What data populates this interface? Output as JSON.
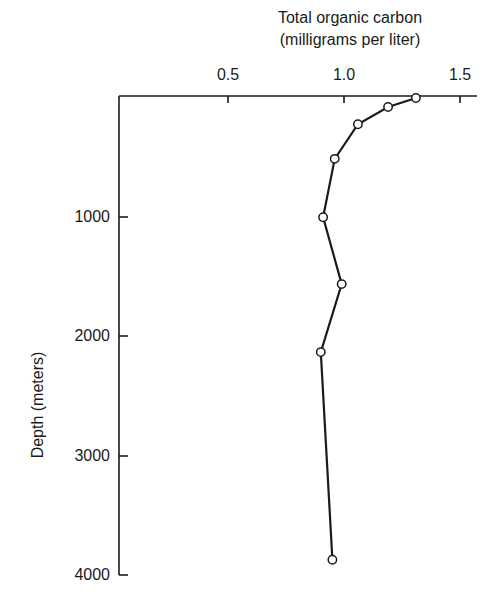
{
  "chart_data": {
    "type": "line",
    "title": "Total organic carbon",
    "subtitle": "(milligrams per liter)",
    "xlabel": "Total organic carbon (milligrams per liter)",
    "ylabel": "Depth (meters)",
    "x_axis_position": "top",
    "y_axis_inverted": true,
    "xlim": [
      0.0,
      1.55
    ],
    "ylim": [
      0,
      4000
    ],
    "x_ticks": [
      "0.5",
      "1.0",
      "1.5"
    ],
    "y_ticks": [
      "1000",
      "2000",
      "3000",
      "4000"
    ],
    "grid": false,
    "legend": null,
    "series": [
      {
        "name": "Total organic carbon profile",
        "marker": "open-circle",
        "points": [
          {
            "toc": 1.31,
            "depth": 0
          },
          {
            "toc": 1.19,
            "depth": 75
          },
          {
            "toc": 1.06,
            "depth": 220
          },
          {
            "toc": 0.96,
            "depth": 510
          },
          {
            "toc": 0.91,
            "depth": 1000
          },
          {
            "toc": 0.99,
            "depth": 1560
          },
          {
            "toc": 0.9,
            "depth": 2130
          },
          {
            "toc": 0.95,
            "depth": 3870
          }
        ]
      }
    ]
  },
  "labels": {
    "title_line1": "Total organic carbon",
    "title_line2": "(milligrams per liter)",
    "ylabel": "Depth (meters)",
    "xticks": [
      "0.5",
      "1.0",
      "1.5"
    ],
    "yticks": [
      "1000",
      "2000",
      "3000",
      "4000"
    ]
  }
}
